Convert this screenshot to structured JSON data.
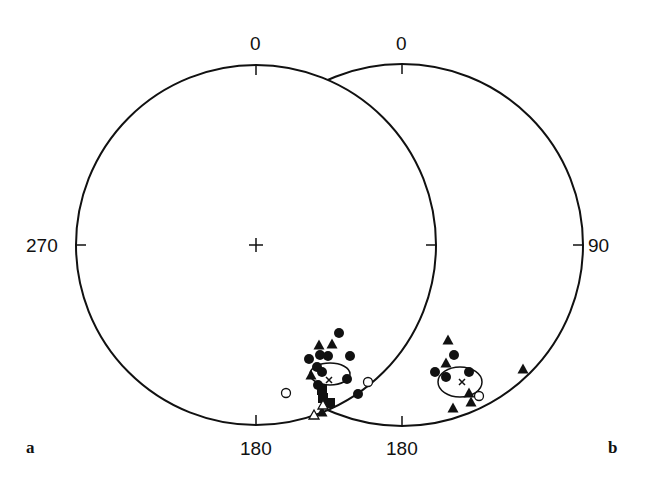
{
  "figure": {
    "panel_labels": {
      "a": "a",
      "b": "b"
    },
    "left_net": {
      "center": [
        256,
        245
      ],
      "radius": 180,
      "labels": {
        "north": "0",
        "west": "270",
        "south": "180"
      }
    },
    "right_net": {
      "center": [
        402,
        245
      ],
      "radius": 181,
      "labels": {
        "north": "0",
        "east": "90",
        "south": "180"
      }
    },
    "colors": {
      "ink": "#111111",
      "background": "#ffffff"
    }
  },
  "chart_data": [
    {
      "type": "scatter",
      "title": "Stereonet a",
      "projection": "equal-area lower hemisphere",
      "axis_labels": [
        "0",
        "90",
        "180",
        "270"
      ],
      "mean_direction": {
        "marker": "x",
        "px": [
          329,
          380
        ]
      },
      "confidence_ellipse": {
        "center_px": [
          330,
          374
        ],
        "rx": 20,
        "ry": 11
      },
      "series": [
        {
          "name": "filled circles",
          "marker": "filled-circle",
          "points_px": [
            [
              339,
              333
            ],
            [
              320,
              355
            ],
            [
              328,
              356
            ],
            [
              350,
              356
            ],
            [
              309,
              359
            ],
            [
              317,
              367
            ],
            [
              347,
              379
            ],
            [
              358,
              394
            ],
            [
              322,
              372
            ],
            [
              318,
              385
            ]
          ]
        },
        {
          "name": "filled triangles",
          "marker": "filled-triangle",
          "points_px": [
            [
              319,
              345
            ],
            [
              332,
              344
            ],
            [
              311,
              375
            ],
            [
              322,
              412
            ]
          ]
        },
        {
          "name": "filled squares",
          "marker": "filled-square",
          "points_px": [
            [
              322,
              390
            ],
            [
              330,
              403
            ],
            [
              323,
              398
            ]
          ]
        },
        {
          "name": "open circles",
          "marker": "open-circle",
          "points_px": [
            [
              368,
              382
            ],
            [
              286,
              393
            ]
          ]
        },
        {
          "name": "open triangles",
          "marker": "open-triangle",
          "points_px": [
            [
              314,
              415
            ],
            [
              323,
              405
            ]
          ]
        }
      ]
    },
    {
      "type": "scatter",
      "title": "Stereonet b",
      "projection": "equal-area lower hemisphere",
      "axis_labels": [
        "0",
        "90",
        "180"
      ],
      "mean_direction": {
        "marker": "x",
        "px": [
          462,
          382
        ]
      },
      "confidence_ellipse": {
        "center_px": [
          460,
          382
        ],
        "rx": 22,
        "ry": 15
      },
      "series": [
        {
          "name": "filled circles",
          "marker": "filled-circle",
          "points_px": [
            [
              454,
              355
            ],
            [
              435,
              372
            ],
            [
              446,
              377
            ],
            [
              469,
              372
            ]
          ]
        },
        {
          "name": "filled triangles",
          "marker": "filled-triangle",
          "points_px": [
            [
              448,
              340
            ],
            [
              446,
              363
            ],
            [
              523,
              369
            ],
            [
              469,
              393
            ],
            [
              471,
              402
            ],
            [
              453,
              408
            ]
          ]
        },
        {
          "name": "open circles",
          "marker": "open-circle",
          "points_px": [
            [
              479,
              396
            ]
          ]
        }
      ]
    }
  ]
}
